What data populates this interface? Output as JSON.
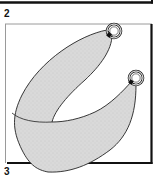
{
  "panels": [
    {
      "id": "panel-2",
      "label": "2"
    },
    {
      "id": "panel-3",
      "label": "3"
    }
  ],
  "illustration": {
    "subject": "curved sling strap with two metal rings",
    "ring_count": 2,
    "colors": {
      "strap_fill": "#d9d9d9",
      "outline": "#222222",
      "frame_dark": "#111111",
      "frame_light": "#9a9a9a",
      "ring_fill": "#ffffff",
      "background": "#ffffff"
    }
  }
}
